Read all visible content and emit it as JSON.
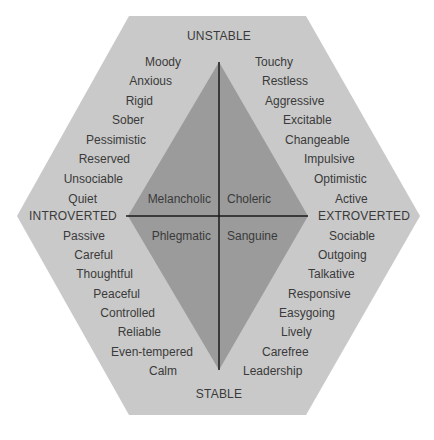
{
  "colors": {
    "hexagon": "#c9c9c9",
    "diamond": "#9b9b9b",
    "line": "#1a1a1a",
    "text": "#3a3a3a"
  },
  "axes": {
    "top": "UNSTABLE",
    "bottom": "STABLE",
    "left": "INTROVERTED",
    "right": "EXTROVERTED"
  },
  "temperaments": {
    "top_left": "Melancholic",
    "top_right": "Choleric",
    "bottom_left": "Phlegmatic",
    "bottom_right": "Sanguine"
  },
  "traits": {
    "upper_left": [
      "Moody",
      "Anxious",
      "Rigid",
      "Sober",
      "Pessimistic",
      "Reserved",
      "Unsociable",
      "Quiet"
    ],
    "upper_right": [
      "Touchy",
      "Restless",
      "Aggressive",
      "Excitable",
      "Changeable",
      "Impulsive",
      "Optimistic",
      "Active"
    ],
    "lower_left": [
      "Passive",
      "Careful",
      "Thoughtful",
      "Peaceful",
      "Controlled",
      "Reliable",
      "Even-tempered",
      "Calm"
    ],
    "lower_right": [
      "Sociable",
      "Outgoing",
      "Talkative",
      "Responsive",
      "Easygoing",
      "Lively",
      "Carefree",
      "Leadership"
    ]
  }
}
